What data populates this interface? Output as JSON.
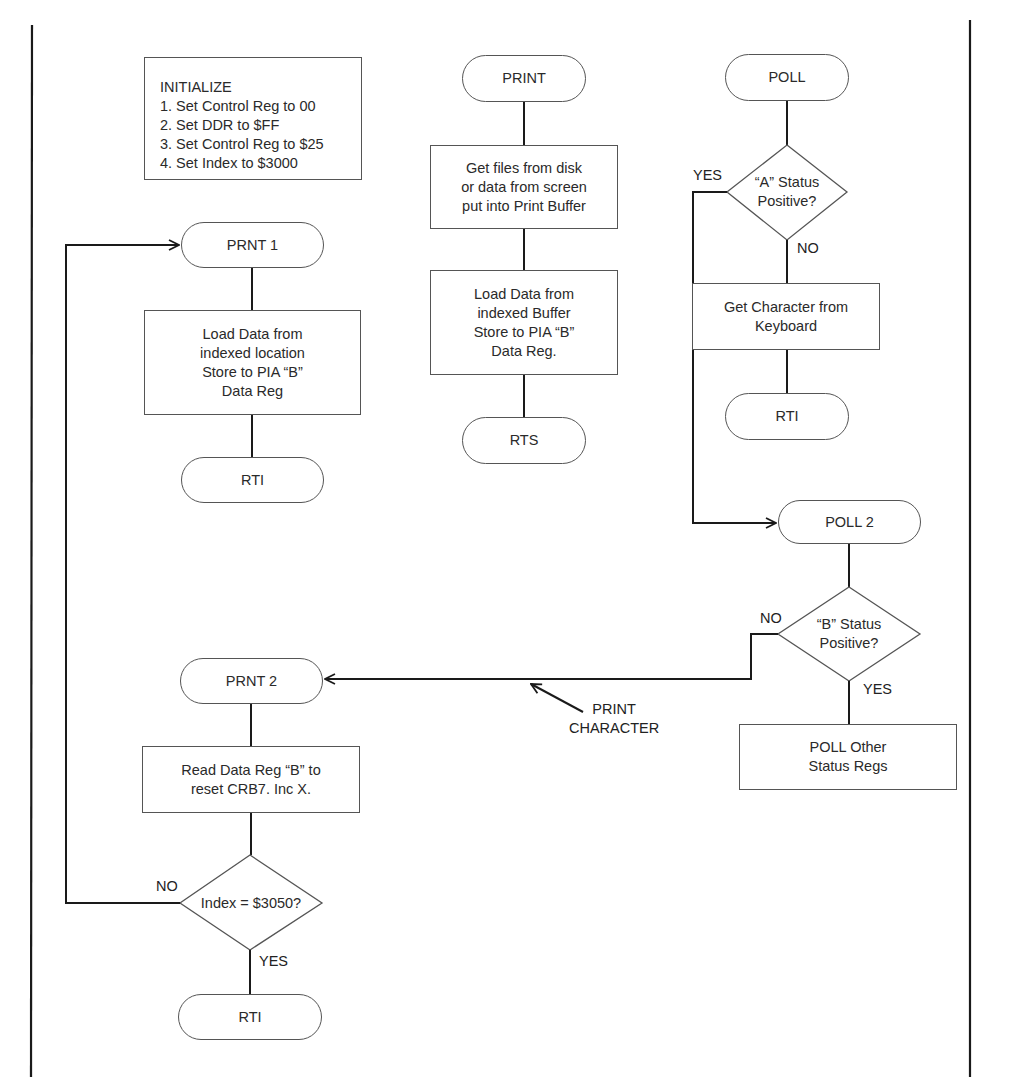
{
  "diagram": {
    "initialize": {
      "title": "INITIALIZE",
      "steps": [
        "1. Set Control Reg to 00",
        "2. Set DDR to $FF",
        "3. Set Control Reg to $25",
        "4. Set Index to $3000"
      ]
    },
    "print_routine": {
      "start": "PRINT",
      "step1": "Get files from disk\nor data from screen\nput into Print Buffer",
      "step2": "Load Data from\nindexed Buffer\nStore to PIA “B”\nData Reg.",
      "end": "RTS"
    },
    "poll_routine": {
      "start": "POLL",
      "decision": "“A” Status\nPositive?",
      "yes_label": "YES",
      "no_label": "NO",
      "step": "Get Character from\nKeyboard",
      "end": "RTI"
    },
    "prnt1_routine": {
      "start": "PRNT 1",
      "step": "Load Data from\nindexed location\nStore to PIA “B”\nData Reg",
      "end": "RTI"
    },
    "poll2_routine": {
      "start": "POLL 2",
      "decision": "“B” Status\nPositive?",
      "no_label": "NO",
      "yes_label": "YES",
      "step": "POLL Other\nStatus Regs",
      "annotation": "PRINT\nCHARACTER"
    },
    "prnt2_routine": {
      "start": "PRNT 2",
      "step": "Read Data Reg “B” to\nreset CRB7. Inc X.",
      "decision": "Index = $3050?",
      "no_label": "NO",
      "yes_label": "YES",
      "end": "RTI"
    },
    "colors": {
      "line": "#1a1a1a",
      "shape_border": "#555555",
      "background": "#ffffff"
    }
  }
}
